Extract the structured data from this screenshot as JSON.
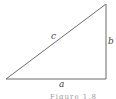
{
  "diagram": {
    "type": "right-triangle",
    "vertices": {
      "bottom_left": [
        6,
        79
      ],
      "bottom_right": [
        106,
        79
      ],
      "top_right": [
        106,
        4
      ]
    },
    "line_color": "#6b6b6b",
    "labels": {
      "hypotenuse": "c",
      "vertical_leg": "b",
      "horizontal_leg": "a"
    },
    "caption": "Figure 1.8"
  }
}
